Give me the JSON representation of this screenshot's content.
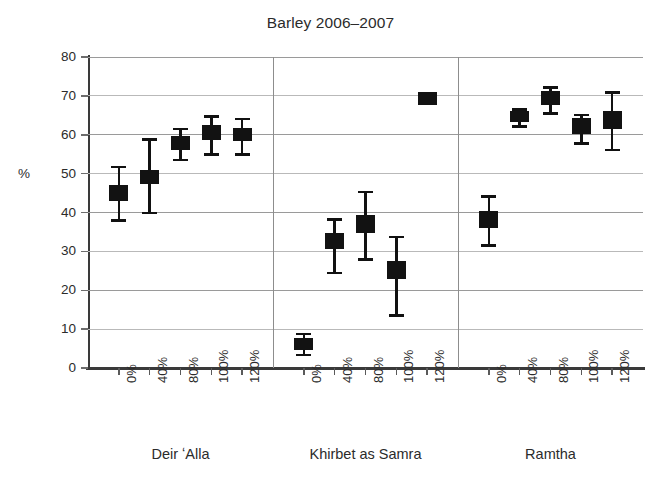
{
  "chart_data": {
    "type": "scatter",
    "title": "Barley 2006–2007",
    "xlabel": "",
    "ylabel": "%",
    "ylim": [
      0,
      80
    ],
    "yticks": [
      0,
      10,
      20,
      30,
      40,
      50,
      60,
      70,
      80
    ],
    "ytick_labels": [
      "0",
      "10",
      "20",
      "30",
      "40",
      "50",
      "60",
      "70",
      "80"
    ],
    "grid": true,
    "legend": "none",
    "marker_style": "filled-square-with-error-bars",
    "marker_color": "#121212",
    "grid_color": "#9a9a9a",
    "axis_color": "#3a3a3a",
    "categories": [
      "0%",
      "40%",
      "80%",
      "100%",
      "120%"
    ],
    "groups": [
      {
        "name": "Deir ʻAlla",
        "points": [
          {
            "x": "0%",
            "value": 45.0,
            "low": 38.0,
            "high": 51.8,
            "box_low": 43.0,
            "box_high": 47.0
          },
          {
            "x": "40%",
            "value": 49.2,
            "low": 39.9,
            "high": 58.8,
            "box_low": 47.2,
            "box_high": 51.0
          },
          {
            "x": "80%",
            "value": 58.0,
            "low": 53.6,
            "high": 61.6,
            "box_low": 56.0,
            "box_high": 59.8
          },
          {
            "x": "100%",
            "value": 60.4,
            "low": 55.0,
            "high": 64.8,
            "box_low": 58.6,
            "box_high": 62.4
          },
          {
            "x": "120%",
            "value": 60.0,
            "low": 55.0,
            "high": 64.1,
            "box_low": 58.4,
            "box_high": 61.8
          }
        ]
      },
      {
        "name": "Khirbet as Samra",
        "points": [
          {
            "x": "0%",
            "value": 6.2,
            "low": 3.4,
            "high": 8.8,
            "box_low": 4.6,
            "box_high": 7.8
          },
          {
            "x": "40%",
            "value": 32.6,
            "low": 24.5,
            "high": 38.3,
            "box_low": 30.6,
            "box_high": 34.6
          },
          {
            "x": "80%",
            "value": 37.0,
            "low": 28.0,
            "high": 45.4,
            "box_low": 34.6,
            "box_high": 39.3
          },
          {
            "x": "100%",
            "value": 25.2,
            "low": 13.6,
            "high": 33.8,
            "box_low": 23.0,
            "box_high": 27.6
          },
          {
            "x": "120%",
            "value": 69.4,
            "low": 69.4,
            "high": 69.4,
            "box_low": 67.6,
            "box_high": 71.1
          }
        ]
      },
      {
        "name": "Ramtha",
        "points": [
          {
            "x": "0%",
            "value": 38.2,
            "low": 31.6,
            "high": 44.2,
            "box_low": 36.0,
            "box_high": 40.4
          },
          {
            "x": "40%",
            "value": 64.8,
            "low": 62.2,
            "high": 66.6,
            "box_low": 63.4,
            "box_high": 66.2
          },
          {
            "x": "80%",
            "value": 69.3,
            "low": 65.6,
            "high": 72.2,
            "box_low": 67.6,
            "box_high": 71.2
          },
          {
            "x": "100%",
            "value": 62.0,
            "low": 57.9,
            "high": 65.2,
            "box_low": 60.3,
            "box_high": 64.2
          },
          {
            "x": "120%",
            "value": 63.6,
            "low": 56.2,
            "high": 70.9,
            "box_low": 61.4,
            "box_high": 66.0
          }
        ]
      }
    ]
  }
}
